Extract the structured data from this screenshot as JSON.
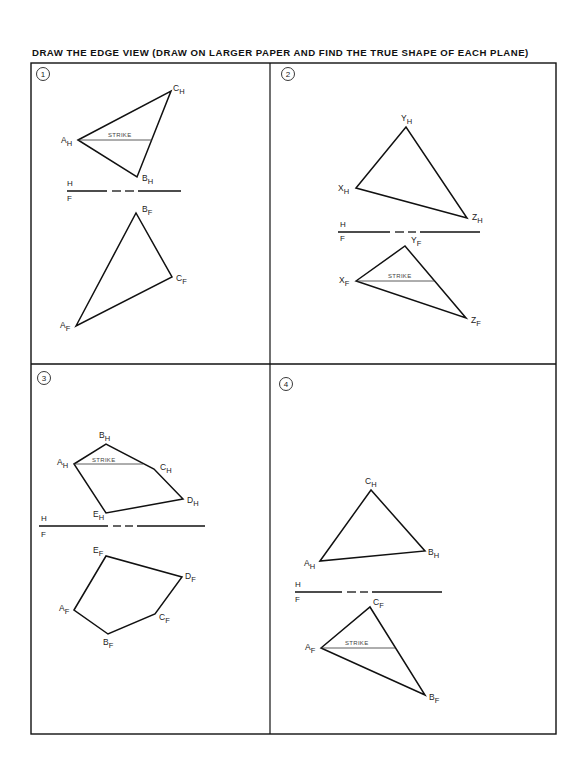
{
  "title": "DRAW THE EDGE VIEW (DRAW ON LARGER PAPER AND FIND THE TRUE SHAPE OF EACH PLANE)",
  "fold_line": {
    "upper": "H",
    "lower": "F"
  },
  "strike_label": "STRIKE",
  "problems": [
    {
      "number": "1",
      "top_view": {
        "points": {
          "A": "A",
          "B": "B",
          "C": "C"
        },
        "subscript": "H"
      },
      "front_view": {
        "subscript": "F"
      }
    },
    {
      "number": "2",
      "top_view": {
        "points": {
          "X": "X",
          "Y": "Y",
          "Z": "Z"
        },
        "subscript": "H"
      },
      "front_view": {
        "subscript": "F"
      }
    },
    {
      "number": "3",
      "top_view": {
        "points": {
          "A": "A",
          "B": "B",
          "C": "C",
          "D": "D",
          "E": "E"
        },
        "subscript": "H"
      },
      "front_view": {
        "subscript": "F"
      }
    },
    {
      "number": "4",
      "top_view": {
        "points": {
          "A": "A",
          "B": "B",
          "C": "C"
        },
        "subscript": "H"
      },
      "front_view": {
        "subscript": "F"
      }
    }
  ]
}
